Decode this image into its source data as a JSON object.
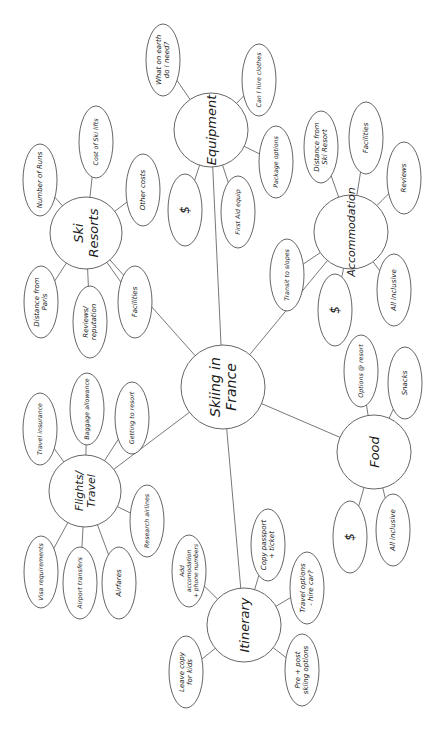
{
  "root": {
    "id": "root",
    "label": [
      "Skiing in",
      "France"
    ]
  },
  "branches": [
    {
      "id": "ski-resorts",
      "label": [
        "Ski",
        "Resorts"
      ],
      "children": [
        {
          "id": "number-of-runs",
          "label": [
            "Number of Runs"
          ]
        },
        {
          "id": "cost-of-ski-lifts",
          "label": [
            "Cost of Ski lifts"
          ]
        },
        {
          "id": "other-costs",
          "label": [
            "Other costs"
          ]
        },
        {
          "id": "distance-from-paris",
          "label": [
            "Distance from",
            "Paris"
          ]
        },
        {
          "id": "reviews-reputation",
          "label": [
            "Reviews/",
            "reputation"
          ]
        },
        {
          "id": "ski-facilities",
          "label": [
            "Facilities"
          ]
        }
      ]
    },
    {
      "id": "equipment",
      "label": [
        "Equipment"
      ],
      "children": [
        {
          "id": "what-do-i-need",
          "label": [
            "What on earth",
            "do I need?"
          ]
        },
        {
          "id": "hire-clothes",
          "label": [
            "Can I hire clothes"
          ]
        },
        {
          "id": "package-options",
          "label": [
            "Package options"
          ]
        },
        {
          "id": "first-aid-equip",
          "label": [
            "First Aid equip"
          ]
        },
        {
          "id": "equipment-cost",
          "label": [
            "$"
          ]
        }
      ]
    },
    {
      "id": "accommodation",
      "label": [
        "Accommodation"
      ],
      "children": [
        {
          "id": "distance-from-ski-resort",
          "label": [
            "Distance from",
            "Ski Resort"
          ]
        },
        {
          "id": "accommodation-facilities",
          "label": [
            "Facilities"
          ]
        },
        {
          "id": "accommodation-reviews",
          "label": [
            "Reviews"
          ]
        },
        {
          "id": "transit-to-slopes",
          "label": [
            "Transit to slopes"
          ]
        },
        {
          "id": "accommodation-cost",
          "label": [
            "$"
          ]
        },
        {
          "id": "accommodation-all-inclusive",
          "label": [
            "All inclusive"
          ]
        }
      ]
    },
    {
      "id": "food",
      "label": [
        "Food"
      ],
      "children": [
        {
          "id": "options-at-resort",
          "label": [
            "Options @ resort"
          ]
        },
        {
          "id": "snacks",
          "label": [
            "Snacks"
          ]
        },
        {
          "id": "food-cost",
          "label": [
            "$"
          ]
        },
        {
          "id": "food-all-inclusive",
          "label": [
            "All inclusive"
          ]
        }
      ]
    },
    {
      "id": "flights-travel",
      "label": [
        "Flights/",
        "Travel"
      ],
      "children": [
        {
          "id": "travel-insurance",
          "label": [
            "Travel insurance"
          ]
        },
        {
          "id": "baggage-allowance",
          "label": [
            "Baggage allowance"
          ]
        },
        {
          "id": "getting-to-resort",
          "label": [
            "Getting to resort"
          ]
        },
        {
          "id": "research-airlines",
          "label": [
            "Research airlines"
          ]
        },
        {
          "id": "visa-requirements",
          "label": [
            "Visa requirements"
          ]
        },
        {
          "id": "airport-transfers",
          "label": [
            "Airport transfers"
          ]
        },
        {
          "id": "airfares",
          "label": [
            "Airfares"
          ]
        }
      ]
    },
    {
      "id": "itinerary",
      "label": [
        "Itinerary"
      ],
      "children": [
        {
          "id": "add-accomodation-numbers",
          "label": [
            "Add",
            "accomodation",
            "+ phone numbers"
          ]
        },
        {
          "id": "copy-passport-ticket",
          "label": [
            "Copy passport",
            "+ ticket"
          ]
        },
        {
          "id": "travel-options-hire-car",
          "label": [
            "Travel options",
            "- hire car?"
          ]
        },
        {
          "id": "pre-post-skiing-options",
          "label": [
            "Pre + post",
            "skiing options"
          ]
        },
        {
          "id": "leave-copy-for-kids",
          "label": [
            "Leave copy",
            "for kids"
          ]
        }
      ]
    }
  ]
}
